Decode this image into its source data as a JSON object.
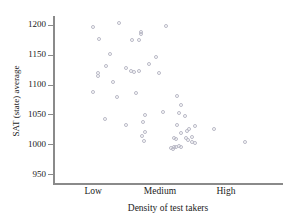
{
  "chart_data": {
    "type": "scatter",
    "title": "",
    "xlabel": "Density of test takers",
    "ylabel": "SAT (state) average",
    "grid": false,
    "legend": null,
    "ylim": [
      935,
      1215
    ],
    "yticks": [
      950,
      1000,
      1050,
      1100,
      1150,
      1200
    ],
    "ytick_labels": [
      "950",
      "1000",
      "1050",
      "1100",
      "1150",
      "1200"
    ],
    "xlim": [
      0,
      1
    ],
    "xticks": [
      0.175,
      0.465,
      0.752
    ],
    "xtick_labels": [
      "Low",
      "Medium",
      "High"
    ],
    "x_is_categorical_scale": true,
    "marker": "open-circle",
    "marker_color": "#b9b9c6",
    "n_points": 62,
    "points": [
      {
        "x": 0.176,
        "y": 1196
      },
      {
        "x": 0.198,
        "y": 1177
      },
      {
        "x": 0.285,
        "y": 1203
      },
      {
        "x": 0.382,
        "y": 1188
      },
      {
        "x": 0.384,
        "y": 1185
      },
      {
        "x": 0.49,
        "y": 1199
      },
      {
        "x": 0.248,
        "y": 1152
      },
      {
        "x": 0.344,
        "y": 1174
      },
      {
        "x": 0.372,
        "y": 1175
      },
      {
        "x": 0.232,
        "y": 1132
      },
      {
        "x": 0.448,
        "y": 1146
      },
      {
        "x": 0.196,
        "y": 1119
      },
      {
        "x": 0.196,
        "y": 1114
      },
      {
        "x": 0.262,
        "y": 1104
      },
      {
        "x": 0.316,
        "y": 1127
      },
      {
        "x": 0.34,
        "y": 1123
      },
      {
        "x": 0.352,
        "y": 1121
      },
      {
        "x": 0.376,
        "y": 1122
      },
      {
        "x": 0.418,
        "y": 1135
      },
      {
        "x": 0.462,
        "y": 1120
      },
      {
        "x": 0.172,
        "y": 1087
      },
      {
        "x": 0.278,
        "y": 1080
      },
      {
        "x": 0.362,
        "y": 1086
      },
      {
        "x": 0.54,
        "y": 1081
      },
      {
        "x": 0.228,
        "y": 1042
      },
      {
        "x": 0.318,
        "y": 1033
      },
      {
        "x": 0.398,
        "y": 1049
      },
      {
        "x": 0.392,
        "y": 1038
      },
      {
        "x": 0.478,
        "y": 1054
      },
      {
        "x": 0.558,
        "y": 1065
      },
      {
        "x": 0.548,
        "y": 1052
      },
      {
        "x": 0.572,
        "y": 1048
      },
      {
        "x": 0.388,
        "y": 1013
      },
      {
        "x": 0.398,
        "y": 1021
      },
      {
        "x": 0.396,
        "y": 1005
      },
      {
        "x": 0.538,
        "y": 1033
      },
      {
        "x": 0.592,
        "y": 1025
      },
      {
        "x": 0.618,
        "y": 1030
      },
      {
        "x": 0.556,
        "y": 1018
      },
      {
        "x": 0.582,
        "y": 1022
      },
      {
        "x": 0.534,
        "y": 1008
      },
      {
        "x": 0.528,
        "y": 1011
      },
      {
        "x": 0.578,
        "y": 1010
      },
      {
        "x": 0.586,
        "y": 1007
      },
      {
        "x": 0.606,
        "y": 1012
      },
      {
        "x": 0.604,
        "y": 1004
      },
      {
        "x": 0.616,
        "y": 1002
      },
      {
        "x": 0.514,
        "y": 994
      },
      {
        "x": 0.522,
        "y": 992
      },
      {
        "x": 0.528,
        "y": 996
      },
      {
        "x": 0.534,
        "y": 995
      },
      {
        "x": 0.546,
        "y": 997
      },
      {
        "x": 0.556,
        "y": 996
      },
      {
        "x": 0.7,
        "y": 1025
      },
      {
        "x": 0.836,
        "y": 1003
      }
    ]
  },
  "axes": {
    "y_title": "SAT (state) average",
    "x_title": "Density of test takers"
  }
}
